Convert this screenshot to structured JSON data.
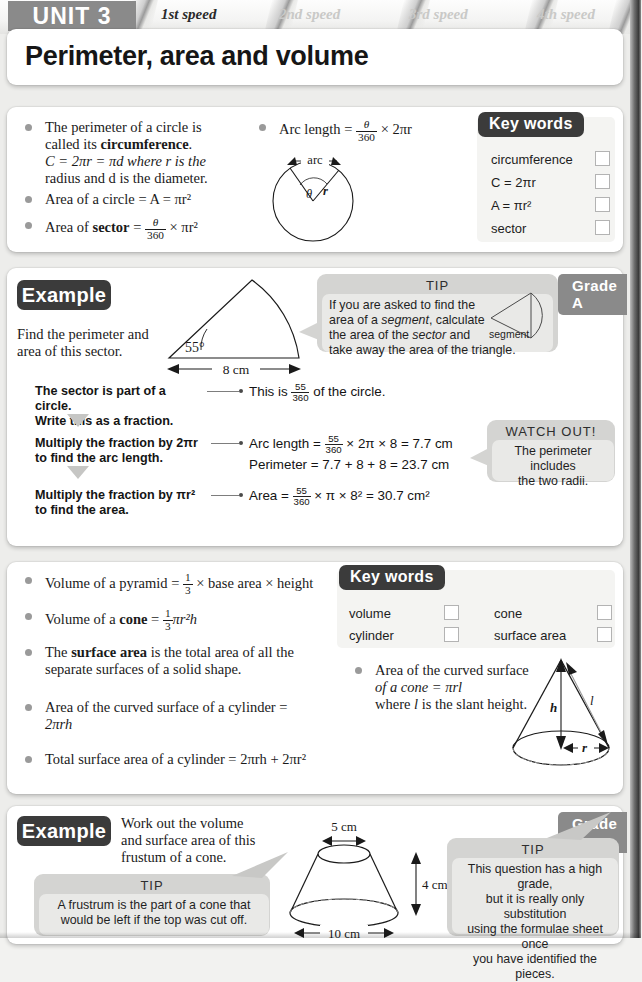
{
  "header": {
    "unit_badge": "UNIT 3",
    "tabs": [
      {
        "label": "1st speed",
        "state": "active"
      },
      {
        "label": "2nd speed",
        "state": "inactive"
      },
      {
        "label": "3rd speed",
        "state": "inactive"
      },
      {
        "label": "4th speed",
        "state": "inactive"
      }
    ],
    "title": "Perimeter, area and volume",
    "badge_color": "#8a8a8a"
  },
  "section1": {
    "bullets": [
      {
        "id": "b1-line1",
        "text": "The perimeter of a circle is"
      },
      {
        "id": "b1-line2a",
        "text": "called its "
      },
      {
        "id": "b1-line2b",
        "text": "circumference"
      },
      {
        "id": "b1-line3",
        "text": "C = 2πr = πd where r is the"
      },
      {
        "id": "b1-line4",
        "text": "radius and d is the diameter."
      },
      {
        "id": "b2",
        "text": "Area of a circle = A = πr²"
      },
      {
        "id": "b3-pre",
        "text": "Area of "
      },
      {
        "id": "b3-bold",
        "text": "sector"
      },
      {
        "id": "b3-eq",
        "text": "="
      },
      {
        "id": "b3-num",
        "text": "θ"
      },
      {
        "id": "b3-den",
        "text": "360"
      },
      {
        "id": "b3-post",
        "text": "× πr²"
      }
    ],
    "arc_bullet": {
      "label": "Arc length",
      "equals": "=",
      "num": "θ",
      "den": "360",
      "post": "× 2πr"
    },
    "circle_diagram": {
      "arc_label": "arc",
      "theta_label": "θ",
      "radius_label": "r"
    },
    "key_words": {
      "title": "Key words",
      "items": [
        "circumference",
        "C = 2πr",
        "A = πr²",
        "sector"
      ]
    }
  },
  "example1": {
    "tab_label": "Example",
    "question_line1": "Find the perimeter and",
    "question_line2": "area of this sector.",
    "grade": "Grade A",
    "diagram": {
      "angle_label": "55°",
      "base_label": "8 cm"
    },
    "tip": {
      "title": "TIP",
      "line1": "If you are asked to find the",
      "line2a": "area of a ",
      "line2b": "segment",
      "line2c": ", calculate",
      "line3a": "the area of the ",
      "line3b": "sector",
      "line3c": " and",
      "line4": "take away the area of the triangle.",
      "diagram_label": "segment"
    },
    "steps": [
      {
        "left_line1": "The sector is part of a circle.",
        "left_line2": "Write this as a fraction.",
        "right_pre": "This is ",
        "right_num": "55",
        "right_den": "360",
        "right_post": " of the circle."
      },
      {
        "left_line1": "Multiply the fraction by 2πr",
        "left_line2": "to find the arc length.",
        "right_pre": "Arc length = ",
        "right_num": "55",
        "right_den": "360",
        "right_post": " × 2π × 8 = 7.7 cm",
        "right_line2": "Perimeter = 7.7 + 8 + 8 = 23.7 cm"
      },
      {
        "left_line1": "Multiply the fraction by πr²",
        "left_line2": "to find the area.",
        "right_pre": "Area = ",
        "right_num": "55",
        "right_den": "360",
        "right_post": " × π × 8² = 30.7 cm²"
      }
    ],
    "watch_out": {
      "title": "WATCH OUT!",
      "line1": "The perimeter includes",
      "line2": "the two radii."
    }
  },
  "section2": {
    "bullets": [
      {
        "pre": "Volume of a pyramid = ",
        "num": "1",
        "den": "3",
        "post": " × base area × height"
      },
      {
        "pre": "Volume of a ",
        "bold": "cone",
        "mid": " = ",
        "num": "1",
        "den": "3",
        "post": "πr²h"
      },
      {
        "pre": "The ",
        "bold": "surface area",
        "post": " is the total area of all the",
        "line2": "separate surfaces of a solid shape."
      },
      {
        "pre": "Area of the curved surface of a cylinder =",
        "line2": "2πrh"
      },
      {
        "pre": "Total surface area of a cylinder = 2πrh + 2πr²"
      }
    ],
    "cone_bullet": {
      "line1": "Area of the curved surface",
      "line2": "of a cone = πrl",
      "line3a": "where ",
      "line3b": "l",
      "line3c": " is the slant height."
    },
    "cone_diagram": {
      "height_label": "h",
      "slant_label": "l",
      "radius_label": "r"
    },
    "key_words": {
      "title": "Key words",
      "col1": [
        "volume",
        "cylinder"
      ],
      "col2": [
        "cone",
        "surface area"
      ]
    }
  },
  "example2": {
    "tab_label": "Example",
    "question_line1": "Work out the volume",
    "question_line2": "and surface area of this",
    "question_line3": "frustum of a cone.",
    "grade": "Grade A",
    "diagram": {
      "top_label": "5 cm",
      "height_label": "4 cm",
      "base_label": "10 cm"
    },
    "tip_left": {
      "title": "TIP",
      "line1": "A frustrum is the part of a cone that",
      "line2": "would be left if the top was cut off."
    },
    "tip_right": {
      "title": "TIP",
      "line1": "This question has a high grade,",
      "line2": "but it is really only substitution",
      "line3": "using the formulae sheet once",
      "line4": "you have identified the pieces."
    }
  }
}
